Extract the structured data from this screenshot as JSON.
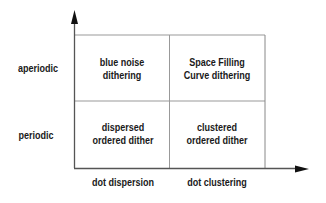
{
  "diagram": {
    "y_axis_labels": [
      "aperiodic",
      "periodic"
    ],
    "x_axis_labels": [
      "dot dispersion",
      "dot clustering"
    ],
    "cells": [
      {
        "row": "aperiodic",
        "col": "dot dispersion",
        "line1": "blue noise",
        "line2": "dithering"
      },
      {
        "row": "aperiodic",
        "col": "dot clustering",
        "line1": "Space Filling",
        "line2": "Curve dithering"
      },
      {
        "row": "periodic",
        "col": "dot dispersion",
        "line1": "dispersed",
        "line2": "ordered dither"
      },
      {
        "row": "periodic",
        "col": "dot clustering",
        "line1": "clustered",
        "line2": "ordered dither"
      }
    ],
    "colors": {
      "axis": "#333333",
      "grid": "#888888",
      "text": "#1a1a1a"
    }
  }
}
